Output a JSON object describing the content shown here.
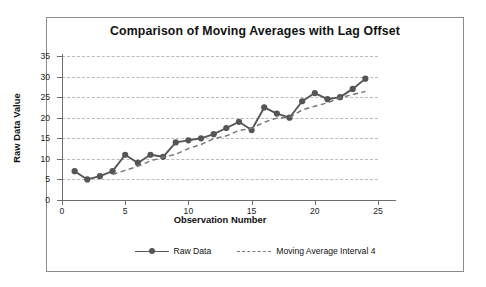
{
  "chart_data": {
    "type": "line",
    "title": "Comparison of Moving Averages with Lag Offset",
    "xlabel": "Observation Number",
    "ylabel": "Raw Data Value",
    "xlim": [
      0,
      25
    ],
    "ylim": [
      0,
      35
    ],
    "xticks": [
      0,
      5,
      10,
      15,
      20,
      25
    ],
    "yticks": [
      0,
      5,
      10,
      15,
      20,
      25,
      30,
      35
    ],
    "grid": "horizontal-dashed",
    "legend_position": "bottom-center",
    "x": [
      1,
      2,
      3,
      4,
      5,
      6,
      7,
      8,
      9,
      10,
      11,
      12,
      13,
      14,
      15,
      16,
      17,
      18,
      19,
      20,
      21,
      22,
      23,
      24
    ],
    "series": [
      {
        "name": "Raw Data",
        "style": "solid-with-round-markers",
        "color": "#555555",
        "x": [
          1,
          2,
          3,
          4,
          5,
          6,
          7,
          8,
          9,
          10,
          11,
          12,
          13,
          14,
          15,
          16,
          17,
          18,
          19,
          20,
          21,
          22,
          23,
          24
        ],
        "values": [
          7,
          5,
          5.8,
          7,
          11,
          9,
          11,
          10.5,
          14,
          14.5,
          15,
          16,
          17.5,
          19,
          17,
          22.5,
          21,
          20,
          24,
          26,
          24.5,
          25,
          27,
          29.5
        ]
      },
      {
        "name": "Moving Average Interval 4",
        "style": "dashed",
        "color": "#777777",
        "x": [
          4,
          5,
          6,
          7,
          8,
          9,
          10,
          11,
          12,
          13,
          14,
          15,
          16,
          17,
          18,
          19,
          20,
          21,
          22,
          23,
          24
        ],
        "values": [
          6.2,
          7.2,
          8.2,
          9.5,
          10.4,
          11.1,
          12.5,
          13.5,
          14.9,
          15.6,
          16.9,
          17.4,
          18.9,
          19.9,
          20.1,
          21.9,
          22.8,
          23.6,
          24.9,
          25.6,
          26.4
        ]
      }
    ]
  },
  "legend": {
    "items": [
      {
        "label": "Raw Data",
        "icon": "solid-line-marker-icon"
      },
      {
        "label": "Moving Average Interval 4",
        "icon": "dashed-line-icon"
      }
    ]
  }
}
